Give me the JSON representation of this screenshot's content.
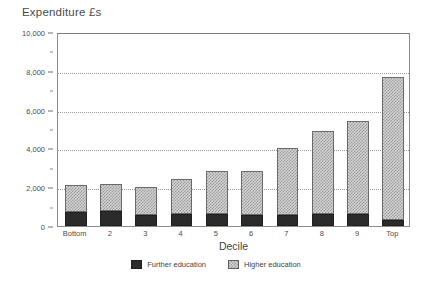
{
  "chart_data": {
    "type": "bar",
    "stacked": true,
    "title": "Expenditure £s",
    "xlabel": "Decile",
    "ylabel": "",
    "categories": [
      "Bottom",
      "2",
      "3",
      "4",
      "5",
      "6",
      "7",
      "8",
      "9",
      "Top"
    ],
    "series": [
      {
        "name": "Further education",
        "color": "#2b2b2b",
        "values": [
          700,
          750,
          550,
          620,
          600,
          580,
          560,
          620,
          600,
          300
        ]
      },
      {
        "name": "Higher education",
        "color": "#d2d2d2",
        "values": [
          1400,
          1400,
          1450,
          1780,
          2250,
          2270,
          3440,
          4280,
          4800,
          7400
        ]
      }
    ],
    "totals": [
      2100,
      2150,
      2000,
      2400,
      2850,
      2850,
      4000,
      4900,
      5400,
      7700
    ],
    "ylim": [
      0,
      10000
    ],
    "y_major_ticks": [
      0,
      2000,
      4000,
      6000,
      8000,
      10000
    ],
    "y_tick_labels": [
      "0",
      "2,000",
      "4,000",
      "6,000",
      "8,000",
      "10,000"
    ],
    "y_minor_ticks": [
      1000,
      3000,
      5000,
      7000,
      9000
    ],
    "gridlines": [
      2000,
      4000,
      6000,
      8000
    ],
    "grid": true,
    "legend_position": "bottom-center"
  },
  "legend": {
    "items": [
      {
        "label": "Further education",
        "swatch": "further-education-swatch"
      },
      {
        "label": "Higher education",
        "swatch": "higher-education-swatch"
      }
    ]
  }
}
